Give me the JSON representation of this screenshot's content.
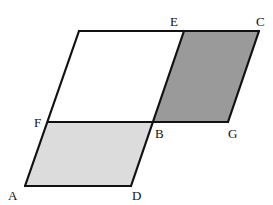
{
  "diagram": {
    "type": "geometry-figure",
    "colors": {
      "stroke": "#111111",
      "light_fill": "#dcdcdc",
      "dark_fill": "#9a9a9a",
      "unshaded_fill": "#ffffff"
    },
    "points": {
      "A": {
        "label": "A",
        "x": 25,
        "y": 186
      },
      "D": {
        "label": "D",
        "x": 131,
        "y": 186
      },
      "F": {
        "label": "F",
        "x": 48,
        "y": 122
      },
      "B": {
        "label": "B",
        "x": 153,
        "y": 122
      },
      "G": {
        "label": "G",
        "x": 228,
        "y": 122
      },
      "E": {
        "label": "E",
        "x": 184,
        "y": 31
      },
      "C": {
        "label": "C",
        "x": 259,
        "y": 31
      },
      "TL": {
        "label": "",
        "x": 79,
        "y": 31
      }
    },
    "labels": {
      "A": "A",
      "B": "B",
      "C": "C",
      "D": "D",
      "E": "E",
      "F": "F",
      "G": "G"
    },
    "regions": [
      {
        "name": "ADBF",
        "shade": "light"
      },
      {
        "name": "EBGC",
        "shade": "dark"
      },
      {
        "name": "upper-white",
        "shade": "none"
      }
    ]
  }
}
